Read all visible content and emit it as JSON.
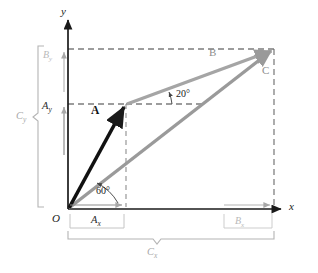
{
  "figure": {
    "background": "#ffffff",
    "colors": {
      "axis": "#1a1a1a",
      "vector_a": "#111111",
      "vector_b": "#9a9a9a",
      "vector_c": "#9a9a9a",
      "dashed_dark": "#333333",
      "dashed_light": "#9a9a9a",
      "bracket": "#b0b0b0",
      "label_faint": "#bcbcbc"
    }
  },
  "axes": {
    "x_label": "x",
    "y_label": "y",
    "origin_label": "O",
    "origin_px": {
      "x": 68,
      "y": 209
    },
    "x_end_px": {
      "x": 283,
      "y": 209
    },
    "y_end_px": {
      "x": 68,
      "y": 18
    }
  },
  "vectors": [
    {
      "name": "vector-a",
      "label": "A",
      "style": "bold-black",
      "from": {
        "x": 68,
        "y": 209
      },
      "to": {
        "x": 126,
        "y": 104
      },
      "angle_from_x_axis_deg": 60,
      "label_px": {
        "x": 97,
        "y": 112
      }
    },
    {
      "name": "vector-b",
      "label": "B",
      "style": "gray",
      "from": {
        "x": 126,
        "y": 104
      },
      "to": {
        "x": 274,
        "y": 49
      },
      "angle_from_horizontal_deg": 20,
      "label_px": {
        "x": 212,
        "y": 53
      }
    },
    {
      "name": "vector-c",
      "label": "C",
      "style": "gray",
      "from": {
        "x": 68,
        "y": 209
      },
      "to": {
        "x": 274,
        "y": 49
      },
      "label_px": {
        "x": 265,
        "y": 72
      }
    }
  ],
  "angles": [
    {
      "name": "angle-60",
      "label": "60°",
      "value": 60,
      "at_px": {
        "x": 103,
        "y": 192
      }
    },
    {
      "name": "angle-20",
      "label": "20°",
      "value": 20,
      "at_px": {
        "x": 180,
        "y": 96
      }
    }
  ],
  "components": {
    "a_y": {
      "label": "A",
      "sub": "y",
      "px": {
        "x": 45,
        "y": 101
      }
    },
    "b_y": {
      "label": "B",
      "sub": "y",
      "px": {
        "x": 45,
        "y": 50
      }
    },
    "c_y": {
      "label": "C",
      "sub": "y",
      "px": {
        "x": 19,
        "y": 117
      }
    },
    "a_x": {
      "label": "A",
      "sub": "x",
      "px": {
        "x": 96,
        "y": 221
      }
    },
    "b_x": {
      "label": "B",
      "sub": "x",
      "px": {
        "x": 238,
        "y": 221
      }
    },
    "c_x": {
      "label": "C",
      "sub": "x",
      "px": {
        "x": 150,
        "y": 252
      }
    }
  },
  "guides": {
    "a_tip_y_dashed": {
      "from": {
        "x": 68,
        "y": 104
      },
      "to": {
        "x": 126,
        "y": 104
      }
    },
    "b_tip_y_dashed": {
      "from": {
        "x": 68,
        "y": 49
      },
      "to": {
        "x": 274,
        "y": 49
      }
    },
    "a_tip_x_dashed": {
      "from": {
        "x": 126,
        "y": 104
      },
      "to": {
        "x": 126,
        "y": 209
      }
    },
    "c_tip_x_dashed": {
      "from": {
        "x": 274,
        "y": 49
      },
      "to": {
        "x": 274,
        "y": 209
      }
    },
    "b_horiz_dashed": {
      "from": {
        "x": 126,
        "y": 104
      },
      "to": {
        "x": 274,
        "y": 104
      }
    }
  }
}
